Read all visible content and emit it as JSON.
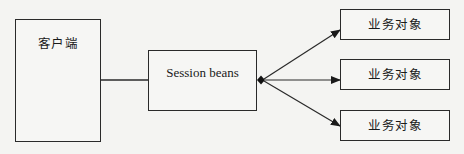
{
  "diagram": {
    "type": "architecture",
    "nodes": [
      {
        "id": "client",
        "label": "客户端"
      },
      {
        "id": "session",
        "label": "Session beans"
      },
      {
        "id": "bo1",
        "label": "业务对象"
      },
      {
        "id": "bo2",
        "label": "业务对象"
      },
      {
        "id": "bo3",
        "label": "业务对象"
      }
    ],
    "edges": [
      {
        "from": "client",
        "to": "session",
        "style": "line"
      },
      {
        "from": "session",
        "to": "bo1",
        "style": "aggregation-arrow"
      },
      {
        "from": "session",
        "to": "bo2",
        "style": "aggregation-arrow"
      },
      {
        "from": "session",
        "to": "bo3",
        "style": "aggregation-arrow"
      }
    ],
    "colors": {
      "stroke": "#2a2a2a",
      "background": "#f4f4f2"
    }
  }
}
